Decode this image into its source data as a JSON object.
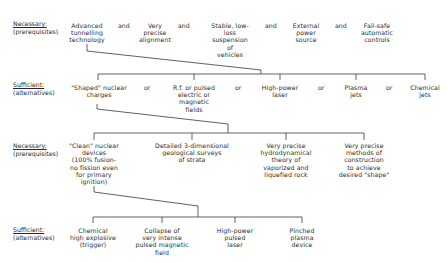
{
  "diagram": {
    "levels": [
      {
        "id": "level1",
        "heading": "Necessary:",
        "subheading": "(prerequisites)",
        "connector": "and",
        "nodes": [
          "Advanced\ntunnelling\ntechnology",
          "Very\nprecise\nalignment",
          "Stable, low-\nloss\nsuspension\nof\nvehicles",
          "External\npower\nsource",
          "Fail-safe\nautomatic\ncontrols"
        ]
      },
      {
        "id": "level2",
        "heading": "Sufficient:",
        "subheading": "(alternatives)",
        "connector": "or",
        "nodes": [
          "\"Shaped\" nuclear\ncharges",
          "R.f. or pulsed\nelectric or\nmagnetic\nfields",
          "High-power\nlaser",
          "Plasma\njets",
          "Chemical\njets"
        ]
      },
      {
        "id": "level3",
        "heading": "Necessary:",
        "subheading": "(prerequisites)",
        "nodes": [
          "\"Clean\" nuclear\ndevices\n(100% fusion-\nno fission even\nfor primary\nignition)",
          "Detailed 3-dimensional\ngeological surveys\nof strata",
          "Very precise\nhydrodynamical\ntheory of\nvaporized and\nliquefied rock",
          "Very precise\nmethods of\nconstruction\nto achieve\ndesired \"shape\""
        ]
      },
      {
        "id": "level4",
        "heading": "Sufficient:",
        "subheading": "(alternatives)",
        "nodes": [
          "Chemical\nhigh explosive\n(trigger)",
          "Collapse of\nvery intense\npulsed magnetic\nfield",
          "High-power\npulsed\nlaser",
          "Pinched\nplasma\ndevice"
        ]
      }
    ],
    "line_color": "#333333"
  }
}
